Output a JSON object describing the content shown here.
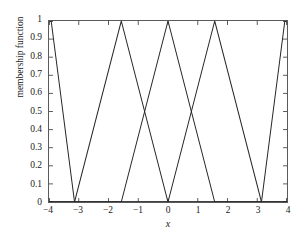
{
  "chart_data": {
    "type": "line",
    "title": "",
    "xlabel": "x",
    "ylabel": "membership function",
    "xlim": [
      -4,
      4
    ],
    "ylim": [
      0,
      1
    ],
    "grid": false,
    "legend": null,
    "x_ticks": [
      -4,
      -3,
      -2,
      -1,
      0,
      1,
      2,
      3,
      4
    ],
    "x_tick_labels": [
      "−4",
      "−3",
      "−2",
      "−1",
      "0",
      "1",
      "2",
      "3",
      "4"
    ],
    "y_ticks": [
      0,
      0.1,
      0.2,
      0.3,
      0.4,
      0.5,
      0.6,
      0.7,
      0.8,
      0.9,
      1
    ],
    "y_tick_labels": [
      "0",
      "0.1",
      "0.2",
      "0.3",
      "0.4",
      "0.5",
      "0.6",
      "0.7",
      "0.8",
      "0.9",
      "1"
    ],
    "line_color": "#262626",
    "line_width": 1,
    "axis_color": "#5a5a5a",
    "background": "#ffffff",
    "series": [
      {
        "name": "mf1",
        "points": [
          [
            -4,
            1.0
          ],
          [
            -3.927,
            1.0
          ],
          [
            -3.1416,
            0.0
          ],
          [
            4,
            0.0
          ]
        ]
      },
      {
        "name": "mf2",
        "points": [
          [
            -4,
            0.0
          ],
          [
            -3.1416,
            0.0
          ],
          [
            -1.5708,
            1.0
          ],
          [
            0.0,
            0.0
          ],
          [
            4,
            0.0
          ]
        ]
      },
      {
        "name": "mf3",
        "points": [
          [
            -4,
            0.0
          ],
          [
            -1.5708,
            0.0
          ],
          [
            0.0,
            1.0
          ],
          [
            1.5708,
            0.0
          ],
          [
            4,
            0.0
          ]
        ]
      },
      {
        "name": "mf4",
        "points": [
          [
            -4,
            0.0
          ],
          [
            0.0,
            0.0
          ],
          [
            1.5708,
            1.0
          ],
          [
            3.1416,
            0.0
          ],
          [
            4,
            0.0
          ]
        ]
      },
      {
        "name": "mf5",
        "points": [
          [
            -4,
            0.0
          ],
          [
            1.5708,
            0.0
          ],
          [
            3.1416,
            0.0
          ],
          [
            3.927,
            1.0
          ],
          [
            4,
            1.0
          ]
        ]
      }
    ],
    "peaks": [
      -3.927,
      -1.5708,
      0.0,
      1.5708,
      3.927
    ],
    "crossing_level": 0.5
  }
}
